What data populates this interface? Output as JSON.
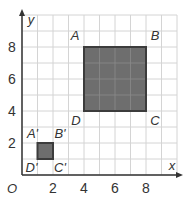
{
  "diagram": {
    "type": "coordinate-grid-dilation",
    "axes": {
      "x_label": "x",
      "y_label": "y",
      "origin_label": "O",
      "x_range": [
        0,
        10
      ],
      "y_range": [
        0,
        10
      ],
      "x_ticks": [
        {
          "value": 2,
          "label": "2"
        },
        {
          "value": 4,
          "label": "4"
        },
        {
          "value": 6,
          "label": "6"
        },
        {
          "value": 8,
          "label": "8"
        }
      ],
      "y_ticks": [
        {
          "value": 2,
          "label": "2"
        },
        {
          "value": 4,
          "label": "4"
        },
        {
          "value": 6,
          "label": "6"
        },
        {
          "value": 8,
          "label": "8"
        }
      ],
      "grid": true
    },
    "shapes": [
      {
        "name": "ABCD",
        "vertices": [
          {
            "label": "A",
            "x": 4,
            "y": 8
          },
          {
            "label": "B",
            "x": 8,
            "y": 8
          },
          {
            "label": "C",
            "x": 8,
            "y": 4
          },
          {
            "label": "D",
            "x": 4,
            "y": 4
          }
        ]
      },
      {
        "name": "A'B'C'D'",
        "vertices": [
          {
            "label": "A'",
            "x": 1,
            "y": 2
          },
          {
            "label": "B'",
            "x": 2,
            "y": 2
          },
          {
            "label": "C'",
            "x": 2,
            "y": 1
          },
          {
            "label": "D'",
            "x": 1,
            "y": 1
          }
        ]
      }
    ],
    "colors": {
      "grid": "#d4d4d4",
      "axis": "#333333",
      "shape_fill": "#6e6e6e",
      "shape_stroke": "#3c3c3c",
      "inner_grid": "#8a8a8a"
    }
  }
}
